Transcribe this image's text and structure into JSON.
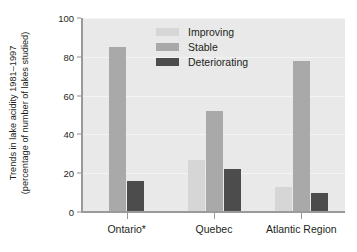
{
  "chart_data": {
    "type": "bar",
    "title": "",
    "xlabel": "",
    "ylabel": "Trends in lake acidity 1981–1997 (percentage of number of lakes studied)",
    "ylabel_line1": "Trends in lake acidity 1981–1997",
    "ylabel_line2": "(percentage of number of lakes studied)",
    "categories": [
      "Ontario*",
      "Quebec",
      "Atlantic Region"
    ],
    "series": [
      {
        "name": "Improving",
        "color": "#d6d6d6",
        "values": [
          null,
          27,
          13
        ]
      },
      {
        "name": "Stable",
        "color": "#a9a9a9",
        "values": [
          85,
          52,
          78
        ]
      },
      {
        "name": "Deteriorating",
        "color": "#4c4c4c",
        "values": [
          16,
          22,
          10
        ]
      }
    ],
    "ylim": [
      0,
      100
    ],
    "yticks": [
      0,
      20,
      40,
      60,
      80,
      100
    ],
    "ytick_labels": [
      "0",
      "20",
      "40",
      "60",
      "80",
      "100"
    ],
    "grid": true,
    "grid_axis": "y",
    "legend_position": "top-center",
    "plot_background": "#e9e9e9",
    "axis_color": "#9a9a9a",
    "text_color": "#231f20"
  },
  "legend": {
    "entries": [
      {
        "label": "Improving"
      },
      {
        "label": "Stable"
      },
      {
        "label": "Deteriorating"
      }
    ]
  }
}
